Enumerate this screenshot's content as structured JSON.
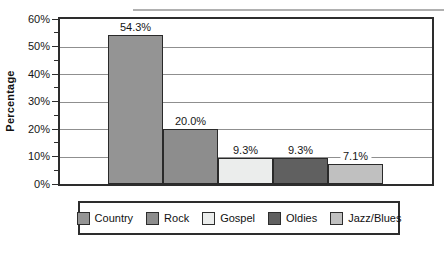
{
  "chart_data": {
    "type": "bar",
    "title": "",
    "xlabel": "",
    "ylabel": "Percentage",
    "categories": [
      "Country",
      "Rock",
      "Gospel",
      "Oldies",
      "Jazz/Blues"
    ],
    "values": [
      54.3,
      20.0,
      9.3,
      9.3,
      7.1
    ],
    "value_labels": [
      "54.3%",
      "20.0%",
      "9.3%",
      "9.3%",
      "7.1%"
    ],
    "bar_colors": [
      "#949494",
      "#8d8d8d",
      "#ebedec",
      "#606060",
      "#c0c0c0"
    ],
    "ylim": [
      0,
      60
    ],
    "ytick_step": 10,
    "minor_tick_step": 5,
    "ytick_labels": [
      "0%",
      "10%",
      "20%",
      "30%",
      "40%",
      "50%",
      "60%"
    ],
    "grid": true,
    "gridline_color": "#8f8f8f",
    "frame_color": "#2d2d2d",
    "legend_position": "bottom"
  },
  "legend": {
    "items": [
      {
        "label": "Country",
        "color": "#949494"
      },
      {
        "label": "Rock",
        "color": "#8d8d8d"
      },
      {
        "label": "Gospel",
        "color": "#ebedec"
      },
      {
        "label": "Oldies",
        "color": "#606060"
      },
      {
        "label": "Jazz/Blues",
        "color": "#c0c0c0"
      }
    ]
  }
}
